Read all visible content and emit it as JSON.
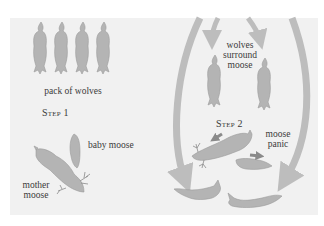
{
  "diagram": {
    "colors": {
      "background": "#ffffff",
      "panel": "#f1f1f1",
      "animal_fill": "#b4b4b4",
      "animal_stroke": "#9a9a9a",
      "arrow": "#bdbdbd",
      "small_arrow": "#8a8a8a",
      "text": "#3a3a3a"
    },
    "step1": {
      "title": "Step 1",
      "wolves_label": "pack of wolves",
      "baby_label": "baby moose",
      "mother_label_line1": "mother",
      "mother_label_line2": "moose",
      "wolf_count": 4
    },
    "step2": {
      "title": "Step 2",
      "surround_line1": "wolves",
      "surround_line2": "surround",
      "surround_line3": "moose",
      "panic_line1": "moose",
      "panic_line2": "panic"
    }
  }
}
